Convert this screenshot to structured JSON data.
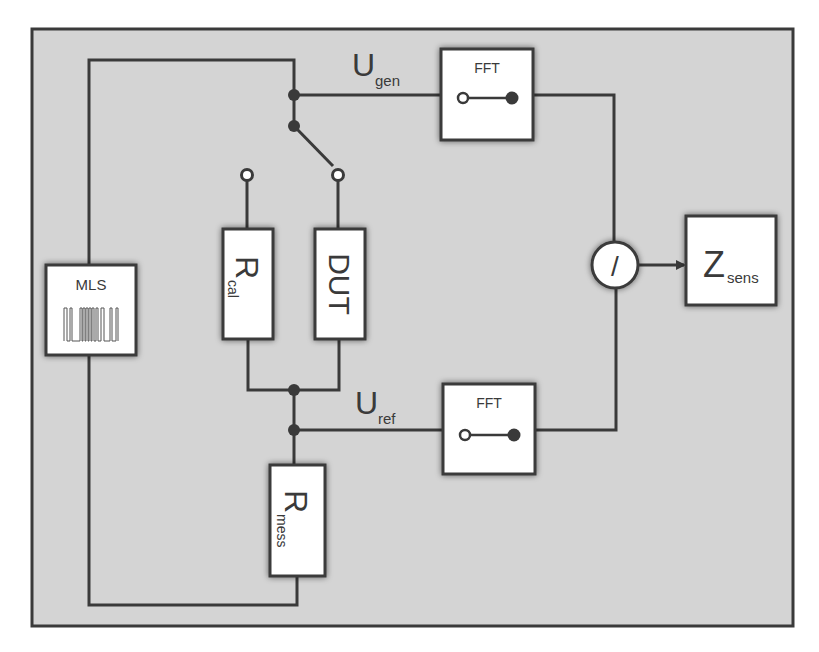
{
  "diagram": {
    "type": "block-diagram",
    "colors": {
      "page_background": "#ffffff",
      "frame_background": "#d4d4d4",
      "line": "#3a3a3a",
      "block_fill": "#ffffff",
      "text": "#3a3a3a"
    },
    "blocks": {
      "mls": {
        "label": "MLS",
        "icon": "mls-sequence-waveform-icon"
      },
      "r_cal": {
        "label_main": "R",
        "label_sub": "cal"
      },
      "dut": {
        "label": "DUT"
      },
      "r_mess": {
        "label_main": "R",
        "label_sub": "mess"
      },
      "fft_gen": {
        "label": "FFT",
        "icon": "open-to-filled-transform-icon"
      },
      "fft_ref": {
        "label": "FFT",
        "icon": "open-to-filled-transform-icon"
      },
      "divider": {
        "label": "/"
      },
      "z_sens": {
        "label_main": "Z",
        "label_sub": "sens"
      }
    },
    "signals": {
      "u_gen": {
        "label_main": "U",
        "label_sub": "gen"
      },
      "u_ref": {
        "label_main": "U",
        "label_sub": "ref"
      }
    },
    "switch": {
      "type": "SPDT",
      "position": "DUT",
      "terminals": [
        "R_cal",
        "DUT"
      ]
    },
    "connections": [
      [
        "MLS",
        "switch common"
      ],
      [
        "switch common",
        "FFT (U_gen)"
      ],
      [
        "switch",
        "R_cal / DUT"
      ],
      [
        "R_cal / DUT",
        "junction"
      ],
      [
        "junction",
        "FFT (U_ref)"
      ],
      [
        "junction",
        "R_mess"
      ],
      [
        "R_mess",
        "MLS"
      ],
      [
        "FFT (U_gen)",
        "divider"
      ],
      [
        "FFT (U_ref)",
        "divider"
      ],
      [
        "divider",
        "Z_sens"
      ]
    ]
  }
}
